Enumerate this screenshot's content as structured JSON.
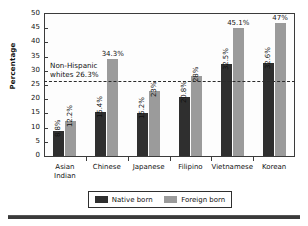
{
  "chart_data": {
    "type": "bar",
    "title": "",
    "xlabel": "",
    "ylabel": "Percentage",
    "ylim": [
      0,
      50
    ],
    "yticks": [
      0,
      5,
      10,
      15,
      20,
      25,
      30,
      35,
      40,
      45,
      50
    ],
    "grid": false,
    "legend_position": "bottom",
    "categories": [
      "Asian Indian",
      "Chinese",
      "Japanese",
      "Filipino",
      "Vietnamese",
      "Korean"
    ],
    "category_lines": [
      [
        "Asian",
        "Indian"
      ],
      [
        "Chinese"
      ],
      [
        "Japanese"
      ],
      [
        "Filipino"
      ],
      [
        "Vietnamese"
      ],
      [
        "Korean"
      ]
    ],
    "series": [
      {
        "name": "Native born",
        "color": "#2f2f2f",
        "values": [
          8.8,
          15.4,
          15.2,
          20.8,
          32.5,
          32.6
        ],
        "labels": [
          "8.8%",
          "15.4%",
          "15.2%",
          "20.8%",
          "32.5%",
          "32.6%"
        ]
      },
      {
        "name": "Foreign born",
        "color": "#9b9b9b",
        "values": [
          12.2,
          34.3,
          23.0,
          28.0,
          45.1,
          47.0
        ],
        "labels": [
          "12.2%",
          "34.3%",
          "23%",
          "28%",
          "45.1%",
          "47%"
        ]
      }
    ],
    "reference_line": {
      "value": 26.3,
      "label_line1": "Non-Hispanic",
      "label_line2": "whites 26.3%",
      "style": "dashed"
    },
    "label_orientation": [
      "vertical",
      "vertical",
      "vertical",
      "vertical",
      "vertical",
      "vertical"
    ],
    "horizontal_value_labels": [
      "34.3%",
      "45.1%",
      "47%"
    ]
  },
  "legend": {
    "items": [
      {
        "label": "Native born",
        "color": "#2f2f2f"
      },
      {
        "label": "Foreign born",
        "color": "#9b9b9b"
      }
    ]
  }
}
